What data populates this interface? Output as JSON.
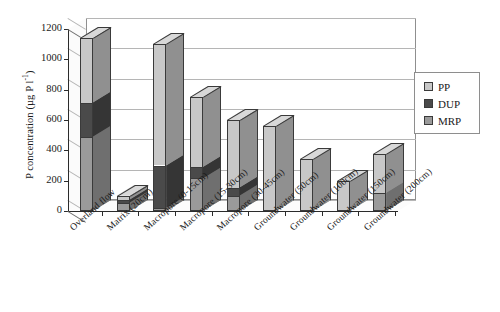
{
  "chart_data": {
    "type": "bar",
    "subtype": "stacked-3d-column",
    "title": "",
    "xlabel": "",
    "ylabel": "P concentration (µg P l-1)",
    "ylabel_parts": {
      "text": "P concentration (µg P l",
      "sup": "-1",
      "tail": ")"
    },
    "ylim": [
      0,
      1200
    ],
    "yticks": [
      0,
      200,
      400,
      600,
      800,
      1000,
      1200
    ],
    "ytick_labels": [
      "0",
      "200",
      "400",
      "600",
      "800",
      "1000",
      "1200"
    ],
    "grid": true,
    "legend_position": "right",
    "categories": [
      "Overland flow",
      "Matrix (20cm)",
      "Macropore (0-15cm)",
      "Macropore (15-30cm)",
      "Macropore (30-45cm)",
      "Groundwater (50cm)",
      "Groundwater (100cm)",
      "Groundwater (150cm)",
      "Groundwater (200cm)"
    ],
    "series": [
      {
        "name": "MRP",
        "color": "#9a9a9a",
        "values": [
          490,
          55,
          20,
          215,
          100,
          0,
          0,
          0,
          120
        ]
      },
      {
        "name": "DUP",
        "color": "#4a4a4a",
        "values": [
          225,
          20,
          280,
          75,
          55,
          0,
          0,
          0,
          0
        ]
      },
      {
        "name": "PP",
        "color": "#c8c8c8",
        "values": [
          425,
          25,
          800,
          460,
          445,
          560,
          340,
          195,
          255
        ]
      }
    ],
    "totals": [
      1140,
      100,
      1100,
      750,
      600,
      560,
      340,
      195,
      375
    ],
    "legend_order": [
      "PP",
      "DUP",
      "MRP"
    ]
  },
  "legend": {
    "items": [
      {
        "label": "PP",
        "color": "#c8c8c8"
      },
      {
        "label": "DUP",
        "color": "#4a4a4a"
      },
      {
        "label": "MRP",
        "color": "#9a9a9a"
      }
    ]
  }
}
